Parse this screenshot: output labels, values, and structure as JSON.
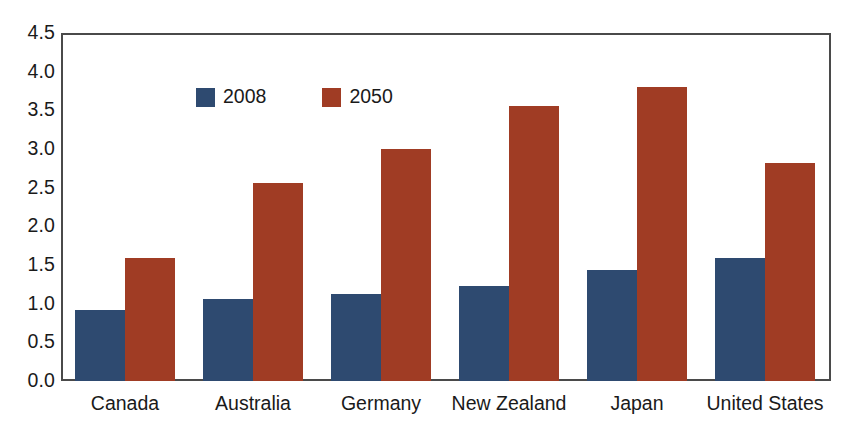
{
  "chart_data": {
    "type": "bar",
    "title": "",
    "subtitle": "",
    "xlabel": "",
    "ylabel": "",
    "categories": [
      "Canada",
      "Australia",
      "Germany",
      "New Zealand",
      "Japan",
      "United States"
    ],
    "series": [
      {
        "name": "2008",
        "color": "#2e4a70",
        "values": [
          0.92,
          1.06,
          1.13,
          1.23,
          1.44,
          1.59
        ]
      },
      {
        "name": "2050",
        "color": "#a03c24",
        "values": [
          1.59,
          2.56,
          3.0,
          3.55,
          3.8,
          2.82
        ]
      }
    ],
    "ylim": [
      0.0,
      4.5
    ],
    "ytick_labels": [
      "4.5",
      "4.0",
      "3.5",
      "3.0",
      "2.5",
      "2.0",
      "1.5",
      "1.0",
      "0.5",
      "0.0"
    ],
    "ytick_values": [
      4.5,
      4.0,
      3.5,
      3.0,
      2.5,
      2.0,
      1.5,
      1.0,
      0.5,
      0.0
    ],
    "grid": false,
    "legend_position": "top-left-inside",
    "frame_color": "#4a4a4a",
    "background": "#ffffff"
  }
}
